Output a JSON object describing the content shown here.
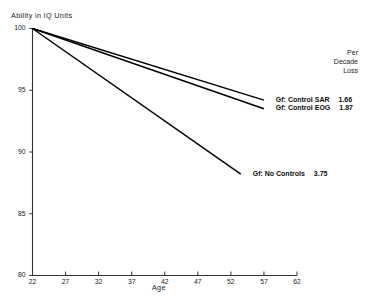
{
  "chart_data": {
    "type": "line",
    "title": "",
    "xlabel": "Age",
    "ylabel": "Ability in IQ Units",
    "xlim": [
      22,
      62
    ],
    "ylim": [
      80,
      100
    ],
    "xticks": [
      22,
      27,
      32,
      37,
      42,
      47,
      52,
      57,
      62
    ],
    "xtick_labels": [
      "22",
      "27",
      "32",
      "37",
      "42",
      "47",
      "52",
      "57",
      "62"
    ],
    "yticks": [
      80,
      85,
      90,
      95,
      100
    ],
    "ytick_labels": [
      "80",
      "85",
      "90",
      "95",
      "100"
    ],
    "grid": false,
    "legend_position": "right-inline",
    "legend_header": [
      "Per",
      "Decade",
      "Loss"
    ],
    "series": [
      {
        "name": "Gf: Control SAR",
        "per_decade_loss": "1.66",
        "x": [
          22,
          57
        ],
        "y": [
          100,
          94.2
        ],
        "label_x": 58.5,
        "label_y": 94.2
      },
      {
        "name": "Gf: Control EOG",
        "per_decade_loss": "1.87",
        "x": [
          22,
          57
        ],
        "y": [
          100,
          93.5
        ],
        "label_x": 58.5,
        "label_y": 93.5
      },
      {
        "name": "Gf: No Controls",
        "per_decade_loss": "3.75",
        "x": [
          22,
          53.5
        ],
        "y": [
          100,
          88.2
        ],
        "label_x": 55,
        "label_y": 88.2
      }
    ]
  },
  "axes": {
    "y_title": "Ability in IQ Units",
    "x_title": "Age"
  },
  "legend": {
    "header_line1": "Per",
    "header_line2": "Decade",
    "header_line3": "Loss",
    "rows": [
      {
        "label": "Gf: Control SAR",
        "value": "1.66"
      },
      {
        "label": "Gf: Control EOG",
        "value": "1.87"
      },
      {
        "label": "Gf: No Controls",
        "value": "3.75"
      }
    ]
  },
  "colors": {
    "line": "#000000",
    "axis": "#333333",
    "text": "#111111",
    "background": "#ffffff"
  }
}
